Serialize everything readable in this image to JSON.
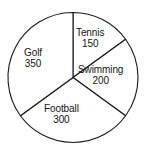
{
  "chart_data": {
    "type": "pie",
    "title": "",
    "subtitle": "",
    "xlabel": "",
    "ylabel": "",
    "total": 1000,
    "start_angle_deg": 0,
    "direction": "clockwise",
    "grid": false,
    "legend": "none",
    "labels_inline": true,
    "categories": [
      "Tennis",
      "Swimming",
      "Football",
      "Golf"
    ],
    "values": [
      150,
      200,
      300,
      350
    ],
    "slices": [
      {
        "name": "Tennis",
        "value": 150,
        "angle_deg": 54,
        "percent": 15,
        "color": "#ffffff"
      },
      {
        "name": "Swimming",
        "value": 200,
        "angle_deg": 72,
        "percent": 20,
        "color": "#ffffff"
      },
      {
        "name": "Football",
        "value": 300,
        "angle_deg": 108,
        "percent": 30,
        "color": "#ffffff"
      },
      {
        "name": "Golf",
        "value": 350,
        "angle_deg": 126,
        "percent": 35,
        "color": "#ffffff"
      }
    ],
    "stroke_color": "#1a1a1a",
    "background_color": "#ffffff"
  },
  "chart": {
    "slice_labels": {
      "tennis": {
        "name": "Tennis",
        "value": "150"
      },
      "swimming": {
        "name": "Swimming",
        "value": "200"
      },
      "football": {
        "name": "Football",
        "value": "300"
      },
      "golf": {
        "name": "Golf",
        "value": "350"
      }
    }
  }
}
